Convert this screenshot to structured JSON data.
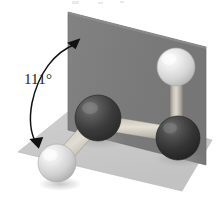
{
  "figure": {
    "kind": "molecular-ball-and-stick-3d",
    "caption_label": "111°",
    "angle_value": 111,
    "angle_unit": "degrees",
    "background_color": "#ffffff"
  },
  "annotation": {
    "angle_text": "111°",
    "arrow_style": "double-headed-curved",
    "arrow_color": "#000000"
  },
  "planes": [
    {
      "name": "vertical-plane",
      "fill": "#7c7c7c",
      "edge": "#6e6e6e",
      "points": "68,12 206,47 206,165 68,130"
    },
    {
      "name": "horizontal-plane",
      "fill": "#c9c9c9",
      "edge": "#bdbdbd",
      "points": "78,104 212,140 182,191 18,152"
    }
  ],
  "atoms": [
    {
      "name": "atom-dark-left",
      "element_color": "dark",
      "cx": 98,
      "cy": 118,
      "r": 23,
      "fill": "#3b3b3b",
      "highlight": "#6a6a6a"
    },
    {
      "name": "atom-dark-right",
      "element_color": "dark",
      "cx": 178,
      "cy": 138,
      "r": 22,
      "fill": "#343434",
      "highlight": "#636363"
    },
    {
      "name": "atom-light-upper",
      "element_color": "light",
      "cx": 176,
      "cy": 67,
      "r": 19,
      "fill": "#d8d8d8",
      "highlight": "#f4f4f4"
    },
    {
      "name": "atom-light-lower",
      "element_color": "light",
      "cx": 57,
      "cy": 163,
      "r": 19,
      "fill": "#d6d6d6",
      "highlight": "#f2f2f2"
    }
  ],
  "bonds": [
    {
      "name": "bond-dark-left-to-dark-right",
      "x1": 98,
      "y1": 122,
      "x2": 178,
      "y2": 134,
      "width": 15,
      "fill": "#c6c2b8"
    },
    {
      "name": "bond-dark-right-to-light-upper",
      "x1": 178,
      "y1": 136,
      "x2": 176,
      "y2": 70,
      "width": 13,
      "fill": "#bcb8ae"
    },
    {
      "name": "bond-dark-left-to-light-lower",
      "x1": 98,
      "y1": 120,
      "x2": 58,
      "y2": 162,
      "width": 14,
      "fill": "#c4c0b6"
    }
  ],
  "arc": {
    "name": "dihedral-angle-arc",
    "path": "M 76,44 C 54,52 38,74 32,104 C 29,120 30,132 36,142",
    "arrowhead_top": "69,38 82,45 70,50",
    "arrowhead_bottom": "31,136 41,150 44,136",
    "stroke": "#121212",
    "stroke_width": 1.6
  }
}
